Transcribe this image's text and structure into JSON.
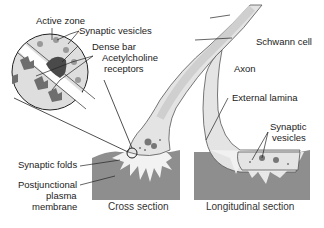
{
  "labels": {
    "active_zone": "Active zone",
    "synaptic_vesicles_inset": "Synaptic vesicles",
    "dense_bar": "Dense bar",
    "ach_receptors_1": "Acetylcholine",
    "ach_receptors_2": "receptors",
    "schwann_cell": "Schwann cell",
    "axon": "Axon",
    "external_lamina": "External lamina",
    "synaptic_vesicles_long_1": "Synaptic",
    "synaptic_vesicles_long_2": "vesicles",
    "synaptic_folds": "Synaptic folds",
    "postjunctional_1": "Postjunctional",
    "postjunctional_2": "plasma",
    "postjunctional_3": "membrane"
  },
  "captions": {
    "cross_section": "Cross section",
    "longitudinal_section": "Longitudinal section"
  },
  "colors": {
    "muscle": "#8e8e8e",
    "cleft": "#f2f2f2",
    "nerve_light": "#e4e4e4",
    "axon": "#cfcfcf",
    "dense_bar": "#4a4a4a",
    "receptor": "#6e6e6e",
    "line": "#1a1a1a"
  }
}
